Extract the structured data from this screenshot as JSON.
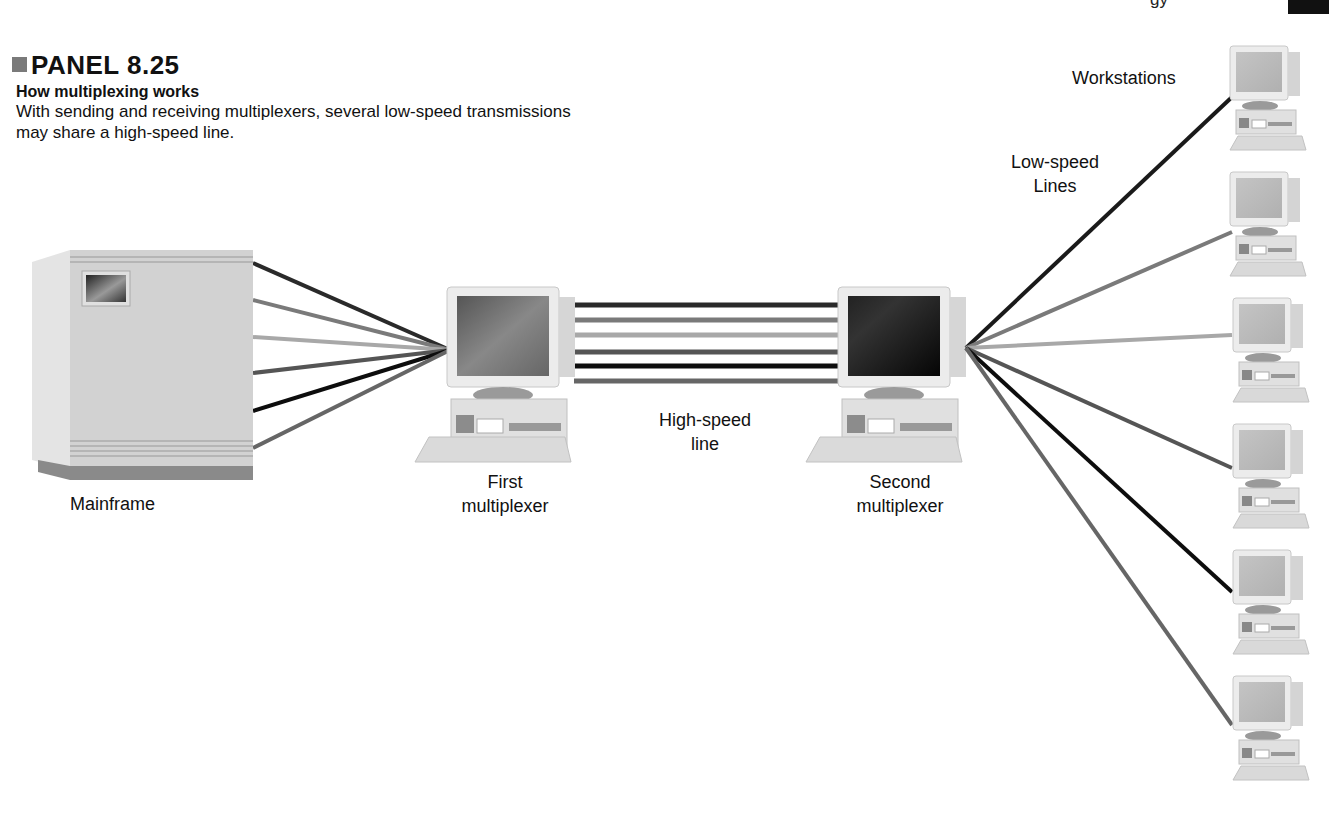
{
  "header": {
    "panel_label": "PANEL 8.25",
    "subtitle": "How multiplexing works",
    "description": "With sending and receiving multiplexers, several low-speed transmissions may share a high-speed line.",
    "running_head_fragment": "gy"
  },
  "diagram": {
    "nodes": {
      "mainframe": {
        "label": "Mainframe"
      },
      "first_mux": {
        "label_line1": "First",
        "label_line2": "multiplexer"
      },
      "second_mux": {
        "label_line1": "Second",
        "label_line2": "multiplexer"
      },
      "workstations": {
        "label": "Workstations",
        "count": 6
      }
    },
    "links": {
      "high_speed": {
        "label_line1": "High-speed",
        "label_line2": "line",
        "channels": 6
      },
      "low_speed": {
        "label_line1": "Low-speed",
        "label_line2": "Lines",
        "count_each_side": 6
      }
    },
    "line_colors": [
      "#2a2a2a",
      "#7a7a7a",
      "#a8a8a8",
      "#555555",
      "#0d0d0d",
      "#666666"
    ]
  }
}
